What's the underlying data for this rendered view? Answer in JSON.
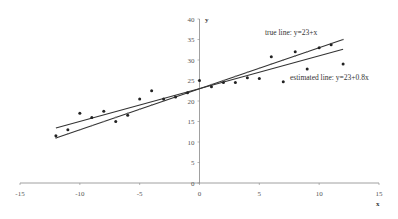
{
  "chart_data": {
    "type": "scatter",
    "title": "",
    "xlabel": "x",
    "ylabel": "y",
    "xlim": [
      -15,
      15
    ],
    "ylim": [
      0,
      40
    ],
    "x_ticks": [
      -15,
      -10,
      -5,
      0,
      5,
      10,
      15
    ],
    "y_ticks": [
      0,
      5,
      10,
      15,
      20,
      25,
      30,
      35,
      40
    ],
    "grid": false,
    "legend": null,
    "series": [
      {
        "name": "observations",
        "kind": "scatter",
        "x": [
          -12,
          -11,
          -10,
          -9,
          -8,
          -7,
          -6,
          -5,
          -4,
          -3,
          -2,
          -1,
          0,
          1,
          2,
          3,
          4,
          5,
          6,
          7,
          8,
          9,
          10,
          11,
          12
        ],
        "y": [
          11.5,
          13,
          17,
          16,
          17.5,
          15,
          16.5,
          20.5,
          22.5,
          20.5,
          21,
          22,
          25,
          23.5,
          24.5,
          24.5,
          25.7,
          25.5,
          30.8,
          24.7,
          32,
          27.8,
          33,
          33.7,
          29
        ]
      },
      {
        "name": "true line: y=23+x",
        "kind": "line",
        "intercept": 23,
        "slope": 1,
        "x_range": [
          -12,
          12
        ]
      },
      {
        "name": "estimated line: y=23+0.8x",
        "kind": "line",
        "intercept": 23,
        "slope": 0.8,
        "x_range": [
          -12,
          12
        ]
      }
    ],
    "annotations": [
      {
        "text": "true line: y=23+x",
        "x": 5,
        "y": 36
      },
      {
        "text": "estimated line: y=23+0.8x",
        "x": 7.3,
        "y": 25
      }
    ]
  },
  "labels": {
    "x_axis_title": "x",
    "y_axis_title": "y",
    "true_line": "true line: y=23+x",
    "estimated_line": "estimated line: y=23+0.8x"
  }
}
